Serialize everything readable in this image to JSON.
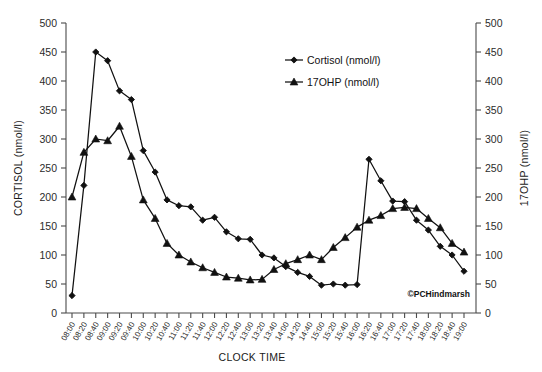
{
  "chart_data": {
    "type": "line",
    "title": "",
    "xlabel": "CLOCK TIME",
    "ylabel": "CORTISOL (nmol/l)",
    "y2label": "17OHP (nmol/l)",
    "ylim": [
      0,
      500
    ],
    "y2lim": [
      0,
      500
    ],
    "yticks": [
      0,
      50,
      100,
      150,
      200,
      250,
      300,
      350,
      400,
      450,
      500
    ],
    "y2ticks": [
      0,
      50,
      100,
      150,
      200,
      250,
      300,
      350,
      400,
      450,
      500
    ],
    "grid": false,
    "legend_position": "top-right",
    "x": [
      "08:00",
      "08:20",
      "08:40",
      "09:00",
      "09:20",
      "09:40",
      "10:00",
      "10:20",
      "10:40",
      "11:00",
      "11:20",
      "11:40",
      "12:00",
      "12:20",
      "12:40",
      "13:00",
      "13:20",
      "13:40",
      "14:00",
      "14:20",
      "14:40",
      "15:00",
      "15:20",
      "15:40",
      "16:00",
      "16:20",
      "16:40",
      "17:00",
      "17:20",
      "17:40",
      "18:00",
      "18:20",
      "18:40",
      "19:00"
    ],
    "series": [
      {
        "name": "Cortisol (nmol/l)",
        "marker": "diamond",
        "axis": "left",
        "color": "#111111",
        "values": [
          30,
          220,
          450,
          435,
          383,
          368,
          280,
          243,
          195,
          185,
          183,
          160,
          165,
          140,
          128,
          127,
          100,
          95,
          80,
          70,
          63,
          48,
          50,
          48,
          49,
          265,
          228,
          193,
          192,
          160,
          143,
          115,
          100,
          72
        ]
      },
      {
        "name": "17OHP (nmol/l)",
        "marker": "triangle",
        "axis": "right",
        "color": "#111111",
        "values": [
          200,
          277,
          300,
          297,
          322,
          270,
          195,
          163,
          120,
          100,
          88,
          78,
          70,
          62,
          60,
          57,
          58,
          75,
          85,
          92,
          100,
          92,
          113,
          130,
          148,
          160,
          168,
          180,
          182,
          180,
          163,
          147,
          120,
          105
        ]
      }
    ],
    "watermark": "©PCHindmarsh"
  },
  "legend": {
    "entries": [
      {
        "label": "Cortisol (nmol/l)",
        "marker": "diamond"
      },
      {
        "label": "17OHP (nmol/l)",
        "marker": "triangle"
      }
    ]
  }
}
